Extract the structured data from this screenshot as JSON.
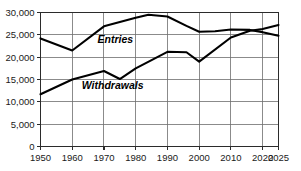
{
  "chart_data": {
    "type": "line",
    "title": "",
    "xlabel": "",
    "ylabel": "",
    "xlim": [
      1950,
      2025
    ],
    "ylim": [
      0,
      30000
    ],
    "grid": true,
    "legend_position": "inline-annotation",
    "x_tick_labels": [
      "1950",
      "1960",
      "1970",
      "1980",
      "1990",
      "2000",
      "2010",
      "2020",
      "2025"
    ],
    "x_ticks": [
      1950,
      1960,
      1970,
      1980,
      1990,
      2000,
      2010,
      2020,
      2025
    ],
    "y_tick_labels": [
      "30,000",
      "25,000",
      "20,000",
      "15,000",
      "10,000",
      "5,000",
      "0"
    ],
    "y_ticks": [
      30000,
      25000,
      20000,
      15000,
      10000,
      5000,
      0
    ],
    "series": [
      {
        "name": "Entries",
        "label": "Entries",
        "color": "#000000",
        "x": [
          1950,
          1960,
          1970,
          1980,
          1984,
          1990,
          1996,
          2000,
          2005,
          2010,
          2016,
          2020,
          2025
        ],
        "values": [
          24200,
          21500,
          26900,
          28800,
          29500,
          29100,
          27000,
          25700,
          25800,
          26200,
          26100,
          25600,
          24800
        ]
      },
      {
        "name": "Withdrawals",
        "label": "Withdrawals",
        "color": "#000000",
        "x": [
          1950,
          1960,
          1970,
          1975,
          1980,
          1990,
          1996,
          2000,
          2010,
          2016,
          2020,
          2025
        ],
        "values": [
          11700,
          15000,
          16900,
          15100,
          17500,
          21200,
          21100,
          19000,
          24400,
          25900,
          26300,
          27200
        ]
      }
    ],
    "annotations": [
      {
        "text": "Entries",
        "x": 1968,
        "y": 23200
      },
      {
        "text": "Withdrawals",
        "x": 1963,
        "y": 12800
      }
    ]
  }
}
